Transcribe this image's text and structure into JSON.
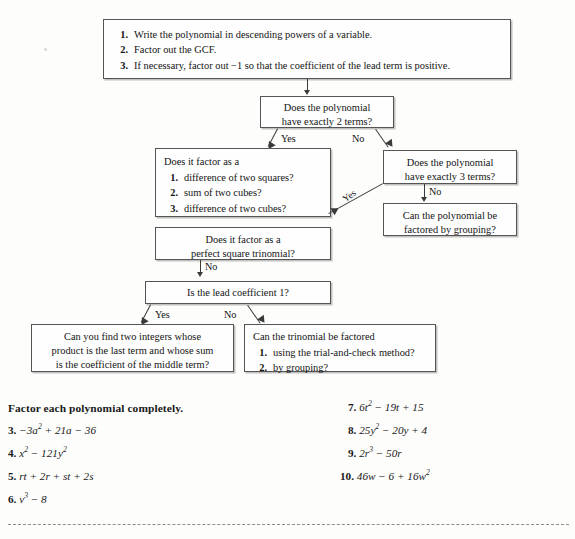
{
  "flowchart": {
    "start_box": {
      "steps": [
        {
          "num": "1.",
          "text": "Write the polynomial in descending powers of a variable."
        },
        {
          "num": "2.",
          "text": "Factor out the GCF."
        },
        {
          "num": "3.",
          "text": "If necessary, factor out −1 so that the coefficient of the lead term is positive."
        }
      ]
    },
    "two_terms": {
      "line1": "Does the polynomial",
      "line2": "have exactly 2 terms?"
    },
    "two_terms_yes_label": "Yes",
    "two_terms_no_label": "No",
    "factor_as": {
      "lead": "Does it factor as a",
      "steps": [
        {
          "num": "1.",
          "text": "difference of two squares?"
        },
        {
          "num": "2.",
          "text": "sum of two cubes?"
        },
        {
          "num": "3.",
          "text": "difference of two cubes?"
        }
      ]
    },
    "three_terms": {
      "line1": "Does the polynomial",
      "line2": "have exactly 3 terms?"
    },
    "three_terms_yes_label": "Yes",
    "three_terms_no_label": "No",
    "grouping": {
      "line1": "Can the polynomial be",
      "line2": "factored by grouping?"
    },
    "perfect_square": {
      "line1": "Does it factor as a",
      "line2": "perfect square trinomial?"
    },
    "perfect_square_no_label": "No",
    "lead_coefficient": {
      "line1": "Is the lead coefficient 1?"
    },
    "lead_yes_label": "Yes",
    "lead_no_label": "No",
    "two_integers": {
      "line1": "Can you find two integers whose",
      "line2": "product is the last term and whose sum",
      "line3": "is the coefficient of the middle term?"
    },
    "trinomial_factored": {
      "lead": "Can the trinomial be factored",
      "steps": [
        {
          "num": "1.",
          "text": "using the trial-and-check method?"
        },
        {
          "num": "2.",
          "text": "by grouping?"
        }
      ]
    }
  },
  "exercises": {
    "heading": "Factor each polynomial completely.",
    "left": [
      {
        "num": "3.",
        "expr_html": "−3<i>a</i><sup>2</sup> + 21<i>a</i> − 36"
      },
      {
        "num": "4.",
        "expr_html": "<i>x</i><sup>2</sup> − 121<i>y</i><sup>2</sup>"
      },
      {
        "num": "5.",
        "expr_html": "<i>rt</i> + 2<i>r</i> + <i>st</i> + 2<i>s</i>"
      },
      {
        "num": "6.",
        "expr_html": "<i>v</i><sup>3</sup> − 8"
      }
    ],
    "right": [
      {
        "num": "7.",
        "expr_html": "6<i>t</i><sup>2</sup> − 19<i>t</i> + 15"
      },
      {
        "num": "8.",
        "expr_html": "25<i>y</i><sup>2</sup> − 20<i>y</i> + 4"
      },
      {
        "num": "9.",
        "expr_html": "2<i>r</i><sup>3</sup> − 50<i>r</i>"
      },
      {
        "num": "10.",
        "expr_html": "46<i>w</i> − 6 + 16<i>w</i><sup>2</sup>"
      }
    ]
  },
  "colors": {
    "page_background": "#fdfdfc",
    "box_border": "#555555",
    "box_fill": "#fefefe",
    "connector": "#3a3a3a",
    "text": "#141414",
    "dashed_rule": "#8d8d8d"
  }
}
